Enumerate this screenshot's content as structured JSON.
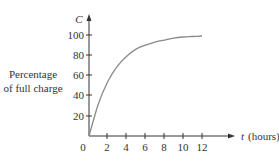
{
  "chart_data": {
    "type": "line",
    "title": "",
    "xlabel": "t (hours)",
    "ylabel": "Percentage of full charge",
    "y_axis_var": "C",
    "x_axis_var": "t",
    "x_unit": "(hours)",
    "x_ticks": [
      2,
      4,
      6,
      8,
      10,
      12
    ],
    "y_ticks": [
      20,
      40,
      60,
      80,
      100
    ],
    "origin_label": "0",
    "xlim": [
      0,
      12
    ],
    "ylim": [
      0,
      100
    ],
    "grid": false,
    "legend": null,
    "series": [
      {
        "name": "C(t)",
        "color": "#8a8a8a",
        "x": [
          0,
          1,
          2,
          3,
          4,
          5,
          6,
          7,
          8,
          9,
          10,
          11,
          12
        ],
        "values": [
          0,
          32,
          54,
          69,
          79,
          86,
          90,
          93,
          95,
          97,
          98,
          98.5,
          99
        ]
      }
    ]
  },
  "labels": {
    "ylabel_line1": "Percentage",
    "ylabel_line2": "of full charge",
    "y_var": "C",
    "x_var": "t",
    "x_unit": "(hours)",
    "origin": "0",
    "x_tick_labels": [
      "2",
      "4",
      "6",
      "8",
      "10",
      "12"
    ],
    "y_tick_labels": [
      "20",
      "40",
      "60",
      "80",
      "100"
    ]
  }
}
